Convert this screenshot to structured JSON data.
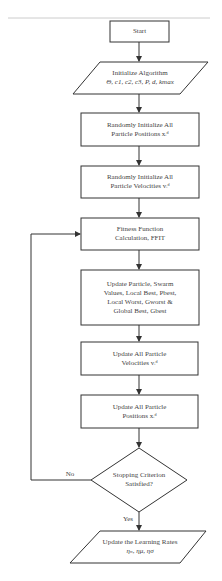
{
  "flowchart": {
    "nodes": [
      {
        "id": "start",
        "shape": "rect",
        "lines": [
          "Start"
        ]
      },
      {
        "id": "init_algo",
        "shape": "parallelogram",
        "lines": [
          "Initialize Algorithm",
          "Θ, c1, c2, c3, P, d,  kmax"
        ]
      },
      {
        "id": "init_pos",
        "shape": "rect",
        "lines": [
          "Randomly Initialize All",
          "Particle Positions  xᵢᵈ"
        ]
      },
      {
        "id": "init_vel",
        "shape": "rect",
        "lines": [
          "Randomly Initialize All",
          "Particle Velocities  vᵢᵈ"
        ]
      },
      {
        "id": "fitness",
        "shape": "rect",
        "lines": [
          "Fitness Function",
          "Calculation, FFIT"
        ]
      },
      {
        "id": "update_best",
        "shape": "rect",
        "lines": [
          "Update Particle,  Swarm",
          "Values, Local Best, Pbest,",
          "Local Worst, Gworst &",
          "Global Best, Gbest"
        ]
      },
      {
        "id": "update_vel",
        "shape": "rect",
        "lines": [
          "Update All Particle",
          "Velocities vᵢᵈ"
        ]
      },
      {
        "id": "update_pos",
        "shape": "rect",
        "lines": [
          "Update All Particle",
          "Positions xᵢᵈ"
        ]
      },
      {
        "id": "stop",
        "shape": "diamond",
        "lines": [
          "Stopping Criterion",
          "Satisfied?"
        ]
      },
      {
        "id": "update_lr",
        "shape": "parallelogram",
        "lines": [
          "Update the Learning Rates",
          "ηₙ, ημ, ησ"
        ]
      }
    ],
    "edges": [
      {
        "from": "start",
        "to": "init_algo",
        "label": ""
      },
      {
        "from": "init_algo",
        "to": "init_pos",
        "label": ""
      },
      {
        "from": "init_pos",
        "to": "init_vel",
        "label": ""
      },
      {
        "from": "init_vel",
        "to": "fitness",
        "label": ""
      },
      {
        "from": "fitness",
        "to": "update_best",
        "label": ""
      },
      {
        "from": "update_best",
        "to": "update_vel",
        "label": ""
      },
      {
        "from": "update_vel",
        "to": "update_pos",
        "label": ""
      },
      {
        "from": "update_pos",
        "to": "stop",
        "label": ""
      },
      {
        "from": "stop",
        "to": "fitness",
        "label": "No"
      },
      {
        "from": "stop",
        "to": "update_lr",
        "label": "Yes"
      }
    ],
    "edge_labels": {
      "no": "No",
      "yes": "Yes"
    },
    "colors": {
      "stroke": "#333333",
      "background": "#ffffff",
      "text": "#444444"
    }
  }
}
